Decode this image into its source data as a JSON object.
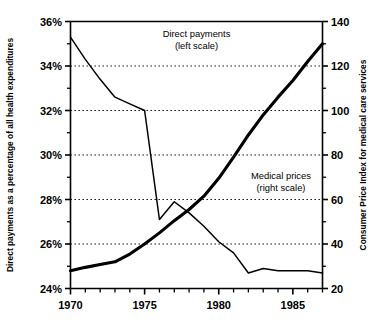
{
  "chart_data": {
    "type": "line",
    "title": "",
    "subtitle": "",
    "xlabel": "",
    "ylabel": "Direct payments as a percentage of all health expenditures",
    "y2label": "Consumer Price Index for medical care services",
    "xlim": [
      1970,
      1987
    ],
    "ylim": [
      24,
      36
    ],
    "y2lim": [
      20,
      140
    ],
    "x_ticks": [
      1970,
      1975,
      1980,
      1985
    ],
    "x_tick_labels": [
      "1970",
      "1975",
      "1980",
      "1985"
    ],
    "x_minor_ticks": [
      1971,
      1972,
      1973,
      1974,
      1976,
      1977,
      1978,
      1979,
      1981,
      1982,
      1983,
      1984,
      1986,
      1987
    ],
    "y_ticks": [
      24,
      26,
      28,
      30,
      32,
      34,
      36
    ],
    "y_tick_labels": [
      "24%",
      "26%",
      "28%",
      "30%",
      "32%",
      "34%",
      "36%"
    ],
    "y_minor_ticks": [
      25,
      27,
      29,
      31,
      33,
      35
    ],
    "y2_ticks": [
      20,
      40,
      60,
      80,
      100,
      120,
      140
    ],
    "y2_tick_labels": [
      "20",
      "40",
      "60",
      "80",
      "100",
      "120",
      "140"
    ],
    "y2_minor_ticks": [
      30,
      50,
      70,
      90,
      110,
      130
    ],
    "grid": "horizontal-dotted",
    "legend": "inline-annotations",
    "annotations": [
      {
        "name": "direct-payments-label",
        "line1": "Direct payments",
        "line2": "(left scale)",
        "x": 1978.5,
        "y": 35.3
      },
      {
        "name": "medical-prices-label",
        "line1": "Medical prices",
        "line2": "(right scale)",
        "x": 1984.2,
        "y": 28.9
      }
    ],
    "x": [
      1970,
      1971,
      1972,
      1973,
      1974,
      1975,
      1976,
      1977,
      1978,
      1979,
      1980,
      1981,
      1982,
      1983,
      1984,
      1985,
      1986,
      1987
    ],
    "series": [
      {
        "name": "Direct payments (left scale)",
        "axis": "left",
        "unit": "percent",
        "style": "thin",
        "values": [
          35.3,
          34.3,
          33.4,
          32.6,
          32.3,
          32.0,
          27.1,
          27.9,
          27.4,
          26.8,
          26.1,
          25.6,
          24.7,
          24.9,
          24.8,
          24.8,
          24.8,
          24.7
        ]
      },
      {
        "name": "Medical prices (right scale)",
        "axis": "right",
        "unit": "index",
        "style": "thick",
        "values": [
          28.0,
          29.5,
          30.8,
          32.0,
          35.5,
          40.0,
          45.0,
          50.5,
          55.5,
          61.5,
          69.5,
          79.0,
          89.0,
          98.0,
          106.0,
          113.5,
          122.0,
          130.0
        ]
      }
    ]
  }
}
